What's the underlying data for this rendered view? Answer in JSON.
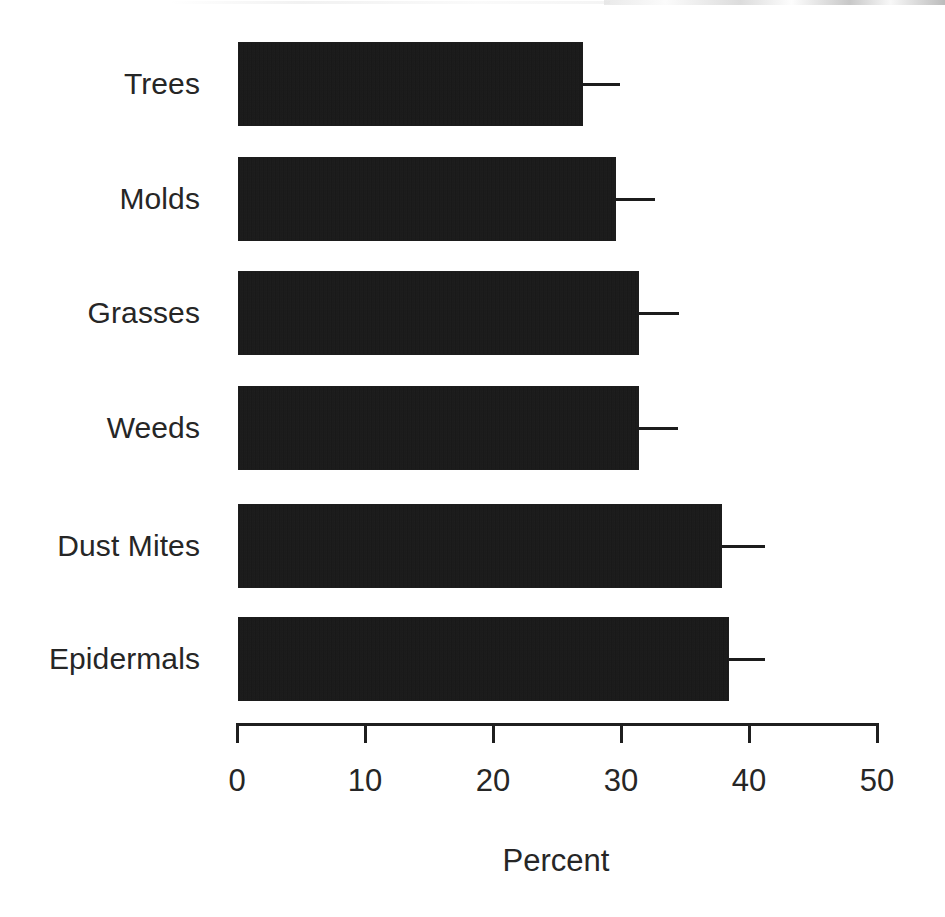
{
  "chart_data": {
    "type": "bar",
    "orientation": "horizontal",
    "title": "",
    "xlabel": "Percent",
    "ylabel": "",
    "categories": [
      "Trees",
      "Molds",
      "Grasses",
      "Weeds",
      "Dust Mites",
      "Epidermals"
    ],
    "values": [
      27.1,
      29.7,
      31.5,
      31.5,
      38.0,
      38.5
    ],
    "error_upper": [
      30.0,
      32.7,
      34.6,
      34.5,
      41.3,
      41.3
    ],
    "xlim": [
      0,
      50
    ],
    "xticks": [
      0,
      10,
      20,
      30,
      40,
      50
    ],
    "xtick_labels": [
      "0",
      "10",
      "20",
      "30",
      "40",
      "50"
    ],
    "grid": false,
    "legend": null,
    "bar_color": "#141414",
    "axis_color": "#1f1f1f",
    "text_color": "#262626",
    "background_color": "#ffffff"
  },
  "axis": {
    "x_title": "Percent",
    "tick_labels": [
      "0",
      "10",
      "20",
      "30",
      "40",
      "50"
    ]
  },
  "bars": [
    {
      "label": "Trees",
      "value": 27.1,
      "error_upper": 30.0
    },
    {
      "label": "Molds",
      "value": 29.7,
      "error_upper": 32.7
    },
    {
      "label": "Grasses",
      "value": 31.5,
      "error_upper": 34.6
    },
    {
      "label": "Weeds",
      "value": 31.5,
      "error_upper": 34.5
    },
    {
      "label": "Dust Mites",
      "value": 38.0,
      "error_upper": 41.3
    },
    {
      "label": "Epidermals",
      "value": 38.5,
      "error_upper": 41.3
    }
  ]
}
